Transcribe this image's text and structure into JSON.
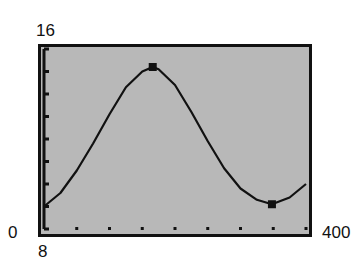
{
  "window": {
    "xmin": "0",
    "xmax": "400",
    "ymin": "8",
    "ymax": "16"
  },
  "colors": {
    "screen_bg": "#b8b8b8",
    "frame": "#111111",
    "curve": "#111111"
  },
  "chart_data": {
    "type": "line",
    "title": "",
    "xlabel": "",
    "ylabel": "",
    "xlim": [
      0,
      400
    ],
    "ylim": [
      8,
      16
    ],
    "x_tick_spacing": 50,
    "y_tick_spacing": 1,
    "grid": false,
    "legend": null,
    "tick_labels": {
      "x": [
        "0",
        "400"
      ],
      "y": [
        "8",
        "16"
      ]
    },
    "series": [
      {
        "name": "curve",
        "x": [
          0,
          25,
          50,
          75,
          100,
          125,
          150,
          166,
          175,
          200,
          225,
          250,
          275,
          300,
          325,
          348,
          375,
          400
        ],
        "values": [
          9.0,
          9.6,
          10.6,
          11.8,
          13.1,
          14.3,
          15.0,
          15.2,
          15.1,
          14.4,
          13.2,
          11.9,
          10.7,
          9.8,
          9.3,
          9.1,
          9.4,
          10.0
        ]
      }
    ],
    "annotations": [
      {
        "type": "marker",
        "label": "maximum",
        "x": 166,
        "y": 15.2
      },
      {
        "type": "marker",
        "label": "minimum",
        "x": 348,
        "y": 9.1
      }
    ]
  }
}
